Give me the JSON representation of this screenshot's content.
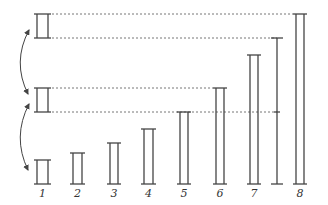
{
  "diagram": {
    "stroke_color": "#444444",
    "baseline_y": 184,
    "bars": [
      {
        "label": "1",
        "x": 34,
        "w": 17,
        "top": 160
      },
      {
        "label": "2",
        "x": 70,
        "w": 15,
        "top": 153
      },
      {
        "label": "3",
        "x": 107,
        "w": 14,
        "top": 143
      },
      {
        "label": "4",
        "x": 141,
        "w": 15,
        "top": 129
      },
      {
        "label": "5",
        "x": 177,
        "w": 14,
        "top": 112
      },
      {
        "label": "6",
        "x": 213,
        "w": 14,
        "top": 88
      },
      {
        "label": "7",
        "x": 247,
        "w": 14,
        "top": 55
      },
      {
        "label": "8",
        "x": 293,
        "w": 14,
        "top": 14
      }
    ],
    "single_rod": {
      "x": 277,
      "top": 38,
      "mid_tick": 112
    },
    "reference_boxes": [
      {
        "name": "top",
        "x": 34,
        "w": 17,
        "top": 14,
        "bottom": 38
      },
      {
        "name": "middle",
        "x": 34,
        "w": 17,
        "top": 88,
        "bottom": 112
      }
    ],
    "dashed_guides": [
      {
        "y": 14,
        "x1": 52,
        "x2": 293
      },
      {
        "y": 38,
        "x1": 52,
        "x2": 277
      },
      {
        "y": 88,
        "x1": 52,
        "x2": 213
      },
      {
        "y": 112,
        "x1": 52,
        "x2": 277
      }
    ],
    "arrows": [
      {
        "name": "upper-curved-double-arrow",
        "from": [
          29,
          30
        ],
        "to": [
          28,
          94
        ]
      },
      {
        "name": "lower-curved-double-arrow",
        "from": [
          29,
          104
        ],
        "to": [
          28,
          170
        ]
      }
    ]
  }
}
